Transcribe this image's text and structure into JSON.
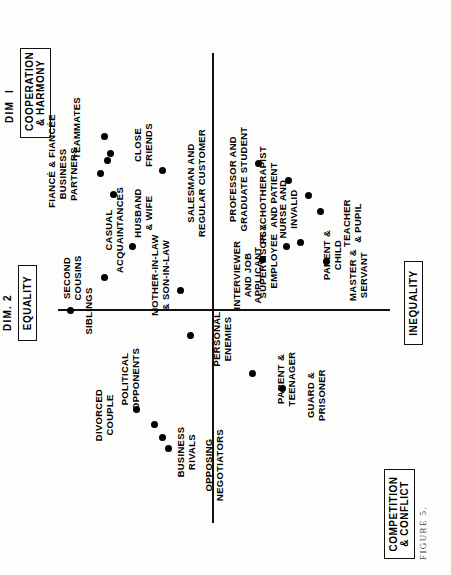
{
  "figure": {
    "caption": "FIGURE 5.",
    "orientation": "rotated-90"
  },
  "axes": {
    "dim1_label": "DIM  I",
    "dim2_label": "DIM. 2",
    "poles": {
      "dim1_positive": "COOPERATION\n& HARMONY",
      "dim1_negative": "COMPETITION\n& CONFLICT",
      "dim2_positive": "EQUALITY",
      "dim2_negative": "INEQUALITY"
    }
  },
  "chart_data": {
    "type": "scatter",
    "title": "FIGURE 5.",
    "xlabel": "DIM  I",
    "ylabel": "DIM. 2",
    "xlim": [
      -1,
      1
    ],
    "ylim": [
      -1,
      1
    ],
    "grid": false,
    "legend": "none",
    "annotations": {
      "x_axis_positive_pole": "COOPERATION & HARMONY",
      "x_axis_negative_pole": "COMPETITION & CONFLICT",
      "y_axis_positive_pole": "EQUALITY",
      "y_axis_negative_pole": "INEQUALITY"
    },
    "points": [
      {
        "label": "SIBLINGS",
        "x": -0.055,
        "y": 0.6,
        "px": 264,
        "py": 70,
        "lx": 264,
        "ly": 84,
        "align": "c"
      },
      {
        "label": "SECOND\nCOUSINS",
        "x": 0.07,
        "y": 0.455,
        "px": 297,
        "py": 104,
        "lx": 297,
        "ly": 62,
        "align": "c"
      },
      {
        "label": "DIVORCED\nCOUPLE",
        "x": -0.43,
        "y": 0.33,
        "px": 165,
        "py": 136,
        "lx": 160,
        "ly": 94,
        "align": "c"
      },
      {
        "label": "BUSINESS\nRIVALS",
        "x": -0.54,
        "y": 0.225,
        "px": 137,
        "py": 162,
        "lx": 123,
        "ly": 176,
        "align": "c"
      },
      {
        "label": "POLITICAL\nOPPONENTS",
        "x": -0.49,
        "y": 0.255,
        "px": 150,
        "py": 154,
        "lx": 196,
        "ly": 120,
        "align": "c"
      },
      {
        "label": "OPPOSING\nNEGOTIATORS",
        "x": -0.58,
        "y": 0.205,
        "px": 126,
        "py": 168,
        "lx": 110,
        "ly": 204,
        "align": "c"
      },
      {
        "label": "CASUAL\nACQUAINTANCES",
        "x": 0.19,
        "y": 0.345,
        "px": 328,
        "py": 132,
        "lx": 345,
        "ly": 104,
        "align": "c"
      },
      {
        "label": "MOTHER-IN-LAW\n& SON-IN-LAW",
        "x": 0.02,
        "y": 0.16,
        "px": 284,
        "py": 180,
        "lx": 300,
        "ly": 150,
        "align": "c"
      },
      {
        "label": "PERSONAL\nENEMIES",
        "x": -0.15,
        "y": 0.12,
        "px": 239,
        "py": 190,
        "lx": 236,
        "ly": 212,
        "align": "c"
      },
      {
        "label": "BUSINESS\nPARTNERS",
        "x": 0.47,
        "y": 0.47,
        "px": 401,
        "py": 100,
        "lx": 401,
        "ly": 58,
        "align": "c"
      },
      {
        "label": "HUSBAND\n& WIFE",
        "x": 0.39,
        "y": 0.415,
        "px": 380,
        "py": 113,
        "lx": 362,
        "ly": 133,
        "align": "c"
      },
      {
        "label": "FIANCÉ & FIANCÉE",
        "x": 0.52,
        "y": 0.44,
        "px": 414,
        "py": 107,
        "lx": 414,
        "ly": 47,
        "align": "c"
      },
      {
        "label": "CLOSE\nFRIENDS",
        "x": 0.545,
        "y": 0.43,
        "px": 421,
        "py": 110,
        "lx": 430,
        "ly": 133,
        "align": "c"
      },
      {
        "label": "TEAMMATES",
        "x": 0.61,
        "y": 0.455,
        "px": 438,
        "py": 104,
        "lx": 447,
        "ly": 72,
        "align": "c"
      },
      {
        "label": "SALESMAN AND\nREGULAR CUSTOMER",
        "x": 0.48,
        "y": 0.225,
        "px": 404,
        "py": 162,
        "lx": 392,
        "ly": 186,
        "align": "c"
      },
      {
        "label": "INTERVIEWER\nAND JOB\nAPPLICANT",
        "x": 0.14,
        "y": -0.155,
        "px": 315,
        "py": 262,
        "lx": 300,
        "ly": 232,
        "align": "c"
      },
      {
        "label": "PARENT &\nTEENAGER",
        "x": -0.26,
        "y": -0.11,
        "px": 201,
        "py": 252,
        "lx": 196,
        "ly": 276,
        "align": "c"
      },
      {
        "label": "GUARD &\nPRISONER",
        "x": -0.32,
        "y": -0.225,
        "px": 186,
        "py": 282,
        "lx": 180,
        "ly": 306,
        "align": "c"
      },
      {
        "label": "SUPERVISOR &\nEMPLOYEE",
        "x": 0.19,
        "y": -0.245,
        "px": 328,
        "py": 286,
        "lx": 314,
        "ly": 258,
        "align": "c"
      },
      {
        "label": "PARENT &\nCHILD",
        "x": 0.205,
        "y": -0.3,
        "px": 332,
        "py": 300,
        "lx": 320,
        "ly": 322,
        "align": "c"
      },
      {
        "label": "MASTER &\nSERVANT",
        "x": 0.135,
        "y": -0.4,
        "px": 313,
        "py": 326,
        "lx": 300,
        "ly": 348,
        "align": "c"
      },
      {
        "label": "PROFESSOR AND\nGRADUATE STUDENT",
        "x": 0.51,
        "y": -0.135,
        "px": 411,
        "py": 258,
        "lx": 396,
        "ly": 228,
        "align": "c"
      },
      {
        "label": "PSYCHOTHERAPIST\nAND PATIENT",
        "x": 0.445,
        "y": -0.25,
        "px": 394,
        "py": 288,
        "lx": 380,
        "ly": 258,
        "align": "c"
      },
      {
        "label": "NURSE AND\nINVALID",
        "x": 0.39,
        "y": -0.325,
        "px": 379,
        "py": 308,
        "lx": 366,
        "ly": 278,
        "align": "c"
      },
      {
        "label": "TEACHER\n& PUPIL",
        "x": 0.33,
        "y": -0.375,
        "px": 363,
        "py": 320,
        "lx": 352,
        "ly": 342,
        "align": "c"
      }
    ]
  }
}
